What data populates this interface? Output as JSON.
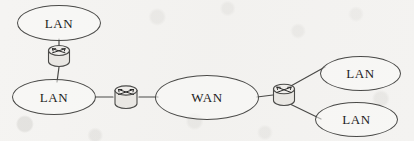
{
  "diagram": {
    "stroke_color": "#4a4a48",
    "text_color": "#1d1d1c",
    "background_color": "#f4f3f1",
    "nodes": [
      {
        "id": "lan-top-left",
        "label": "LAN",
        "type": "cloud",
        "x": 17,
        "y": 5,
        "w": 84,
        "h": 36
      },
      {
        "id": "router-left",
        "label": "",
        "type": "router",
        "x": 46,
        "y": 43,
        "w": 26,
        "h": 26,
        "orientation": "vertical"
      },
      {
        "id": "lan-bottom-left",
        "label": "LAN",
        "type": "cloud",
        "x": 12,
        "y": 79,
        "w": 84,
        "h": 36
      },
      {
        "id": "router-middle",
        "label": "",
        "type": "router",
        "x": 112,
        "y": 84,
        "w": 28,
        "h": 26,
        "orientation": "horizontal"
      },
      {
        "id": "wan",
        "label": "WAN",
        "type": "cloud",
        "x": 155,
        "y": 75,
        "w": 104,
        "h": 45
      },
      {
        "id": "router-right",
        "label": "",
        "type": "router",
        "x": 271,
        "y": 82,
        "w": 26,
        "h": 26,
        "orientation": "horizontal"
      },
      {
        "id": "lan-top-right",
        "label": "LAN",
        "type": "cloud",
        "x": 320,
        "y": 56,
        "w": 81,
        "h": 35
      },
      {
        "id": "lan-bottom-right",
        "label": "LAN",
        "type": "cloud",
        "x": 315,
        "y": 102,
        "w": 83,
        "h": 35
      }
    ],
    "links": [
      {
        "id": "link-lan-top-left-to-router-left",
        "from": "lan-top-left",
        "to": "router-left",
        "x1": 59,
        "y1": 39,
        "x2": 59,
        "y2": 45
      },
      {
        "id": "link-router-left-to-lan-bottom-left",
        "from": "router-left",
        "to": "lan-bottom-left",
        "x1": 59,
        "y1": 67,
        "x2": 57,
        "y2": 81
      },
      {
        "id": "link-lan-bottom-left-to-router-middle",
        "from": "lan-bottom-left",
        "to": "router-middle",
        "x1": 95,
        "y1": 97,
        "x2": 113,
        "y2": 97
      },
      {
        "id": "link-router-middle-to-wan",
        "from": "router-middle",
        "to": "wan",
        "x1": 139,
        "y1": 97,
        "x2": 157,
        "y2": 97
      },
      {
        "id": "link-wan-to-router-right",
        "from": "wan",
        "to": "router-right",
        "x1": 258,
        "y1": 97,
        "x2": 273,
        "y2": 95
      },
      {
        "id": "link-router-right-to-lan-top-right",
        "from": "router-right",
        "to": "lan-top-right",
        "x1": 289,
        "y1": 86,
        "x2": 324,
        "y2": 66
      },
      {
        "id": "link-router-right-to-lan-bottom-right",
        "from": "router-right",
        "to": "lan-bottom-right",
        "x1": 290,
        "y1": 104,
        "x2": 320,
        "y2": 119
      }
    ],
    "icons": {
      "router_icon_name": "router-icon",
      "cloud_icon_name": "network-cloud-icon"
    }
  }
}
